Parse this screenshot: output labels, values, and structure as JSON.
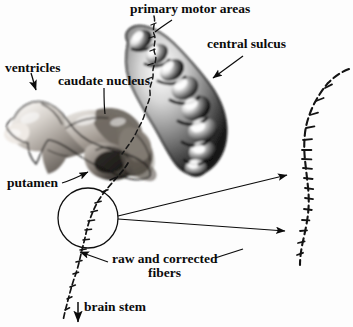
{
  "figure": {
    "type": "annotated-anatomical-rendering",
    "background_color": "#fdfdfd",
    "ink_color": "#0b0b0b"
  },
  "labels": {
    "primary_motor_areas": "primary motor areas",
    "central_sulcus": "central sulcus",
    "ventricles": "ventricles",
    "caudate_nucleus": "caudate nucleus",
    "putamen": "putamen",
    "raw_and_corrected_line1": "raw and corrected",
    "raw_and_corrected_line2": "fibers",
    "brain_stem": "brain stem"
  },
  "structures": [
    {
      "name": "primary-motor-areas-surface",
      "description": "elongated lumpy grayscale 3D surface rendering of the precentral gyrus, oriented upper-left to lower-right",
      "shading": "grayscale with specular highlights"
    },
    {
      "name": "ventricles-caudate-putamen-surface",
      "description": "sepia-gray 3D surface rendering of lateral ventricle, caudate nucleus and putamen",
      "shading": "grayscale with brown tint and semi-transparent overlays"
    }
  ],
  "fibers": {
    "magnified_circle": {
      "name": "magnification-circle",
      "center_x": 88,
      "center_y": 218,
      "radius": 30
    },
    "tracts": [
      {
        "name": "corticospinal-fiber-descending",
        "style": "dashed-with-ticks"
      },
      {
        "name": "corticospinal-fiber-from-motor-area",
        "style": "dashed"
      },
      {
        "name": "magnified-fiber-detail",
        "style": "dashed-with-ticks"
      }
    ]
  },
  "arrows": [
    {
      "name": "ventricles-arrow",
      "points_to": "ventricles"
    },
    {
      "name": "central-sulcus-arrow",
      "points_to": "central sulcus"
    },
    {
      "name": "putamen-arrow",
      "points_to": "putamen"
    },
    {
      "name": "brain-stem-arrow",
      "points_to": "brain stem"
    },
    {
      "name": "magnification-arrow-upper",
      "points_to": "magnified fiber top"
    },
    {
      "name": "magnification-arrow-lower",
      "points_to": "magnified fiber bottom"
    },
    {
      "name": "raw-corrected-arrow",
      "points_to": "raw fiber"
    }
  ],
  "leader_lines": [
    {
      "name": "primary-motor-areas-leader"
    },
    {
      "name": "caudate-nucleus-leader"
    },
    {
      "name": "raw-corrected-leader-left"
    },
    {
      "name": "raw-corrected-leader-right"
    }
  ]
}
